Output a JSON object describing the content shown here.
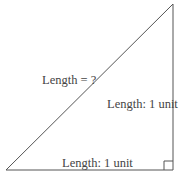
{
  "diagram": {
    "type": "right-triangle",
    "vertices": {
      "bottom_left": [
        6,
        170
      ],
      "bottom_right": [
        173,
        170
      ],
      "top_right": [
        173,
        4
      ]
    },
    "right_angle_at": "bottom_right",
    "labels": {
      "hypotenuse": "Length = ?",
      "vertical_side": "Length: 1 unit",
      "base": "Length: 1 unit"
    },
    "colors": {
      "line": "#555555",
      "text": "#444444",
      "background": "#ffffff"
    }
  }
}
